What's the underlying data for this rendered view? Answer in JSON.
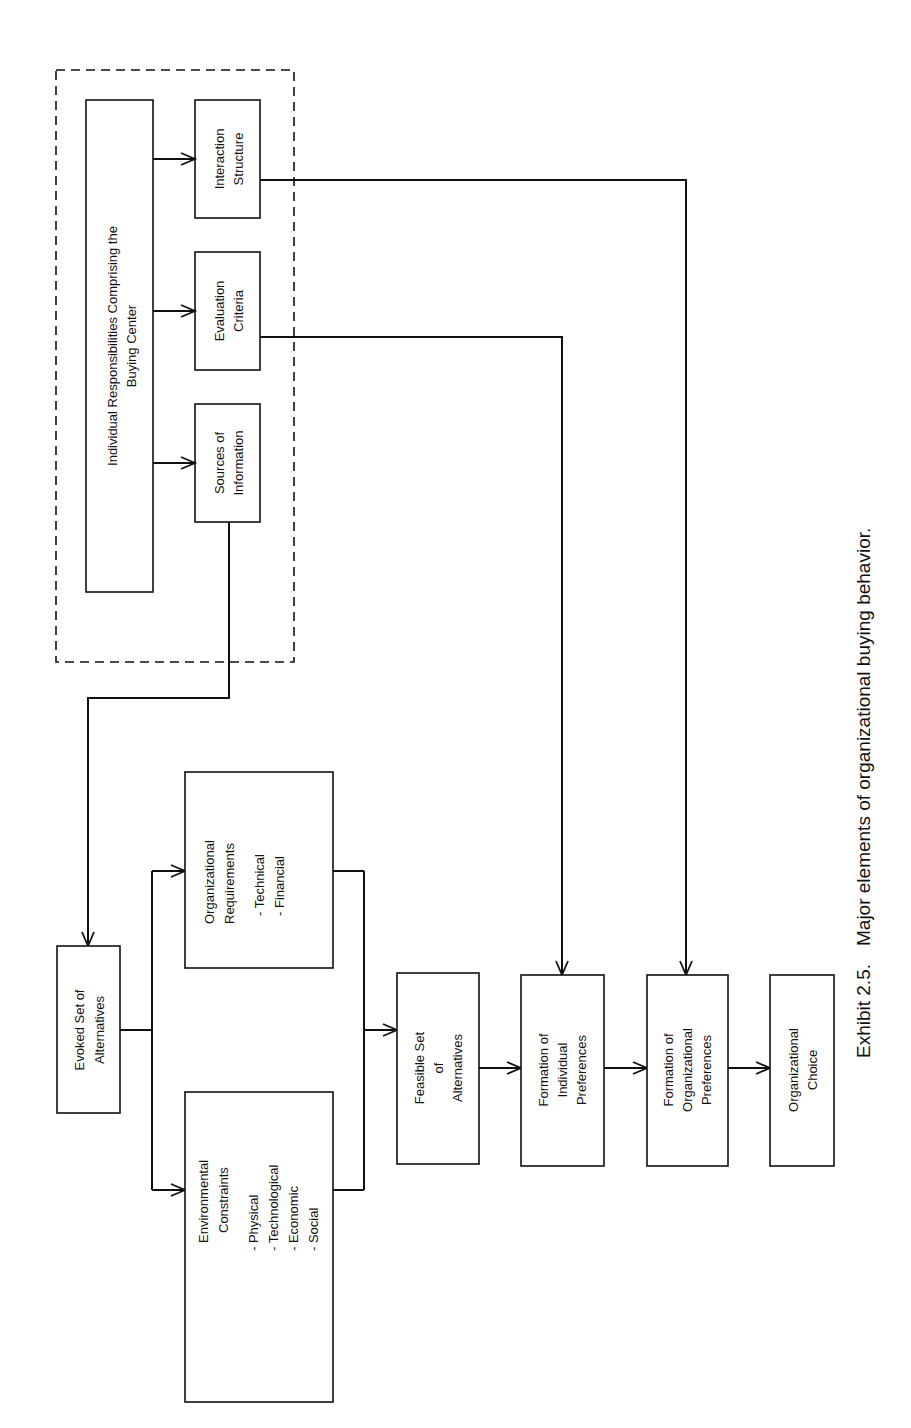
{
  "caption": {
    "exhibit": "Exhibit 2.5.",
    "title": "Major elements of organizational buying behavior."
  },
  "buying_center": {
    "main": [
      "Individual Responsibilities Comprising the",
      "Buying Center"
    ],
    "interaction": [
      "Interaction",
      "Structure"
    ],
    "evaluation": [
      "Evaluation",
      "Criteria"
    ],
    "sources": [
      "Sources of",
      "Information"
    ]
  },
  "evoked": [
    "Evoked Set of",
    "Alternatives"
  ],
  "org_req": {
    "title": [
      "Organizational",
      "Requirements"
    ],
    "items": [
      "-  Technical",
      "-  Financial"
    ]
  },
  "env": {
    "title": [
      "Environmental",
      "Constraints"
    ],
    "items": [
      "-  Physical",
      "-  Technological",
      "-  Economic",
      "-  Social"
    ]
  },
  "feasible": [
    "Feasible Set",
    "of",
    "Alternatives"
  ],
  "indiv_pref": [
    "Formation of",
    "Individual",
    "Preferences"
  ],
  "org_pref": [
    "Formation of",
    "Organizational",
    "Preferences"
  ],
  "choice": [
    "Organizational",
    "Choice"
  ]
}
